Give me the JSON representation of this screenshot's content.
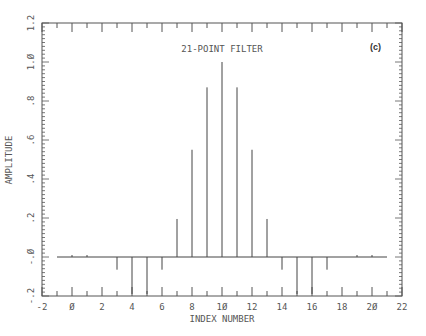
{
  "chart_data": {
    "type": "bar",
    "style": "stem",
    "title": "21-POINT FILTER",
    "panel_label": "(c)",
    "xlabel": "INDEX NUMBER",
    "ylabel": "AMPLITUDE",
    "xlim": [
      -2,
      22
    ],
    "ylim": [
      -0.2,
      1.2
    ],
    "x_ticks": [
      -2,
      0,
      2,
      4,
      6,
      8,
      10,
      12,
      14,
      16,
      18,
      20,
      22
    ],
    "x_tick_labels": [
      "-2",
      "Ø",
      "2",
      "4",
      "6",
      "8",
      "1Ø",
      "12",
      "14",
      "16",
      "18",
      "2Ø",
      "22"
    ],
    "y_ticks": [
      -0.2,
      0.0,
      0.2,
      0.4,
      0.6,
      0.8,
      1.0,
      1.2
    ],
    "y_tick_labels": [
      "-.2",
      "-.Ø",
      ".2",
      ".4",
      ".6",
      ".8",
      "1.Ø",
      "1.2"
    ],
    "grid": false,
    "baseline": {
      "y": 0,
      "x_from": -1,
      "x_to": 21
    },
    "x": [
      -1,
      0,
      1,
      2,
      3,
      4,
      5,
      6,
      7,
      8,
      9,
      10,
      11,
      12,
      13,
      14,
      15,
      16,
      17,
      18,
      19,
      20,
      21
    ],
    "values": [
      0.0,
      0.01,
      0.01,
      0.0,
      -0.065,
      -0.19,
      -0.19,
      -0.065,
      0.195,
      0.55,
      0.87,
      1.0,
      0.87,
      0.55,
      0.195,
      -0.065,
      -0.19,
      -0.19,
      -0.065,
      0.0,
      0.01,
      0.01,
      0.0
    ]
  },
  "colors": {
    "axis": "#555555",
    "stem": "#444444",
    "text": "#555555"
  }
}
